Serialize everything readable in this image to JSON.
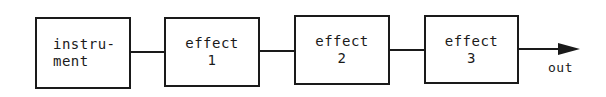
{
  "diagram": {
    "type": "signal-chain-block-diagram",
    "blocks": [
      {
        "id": "instrument",
        "lines": [
          "instru-",
          "ment"
        ]
      },
      {
        "id": "effect1",
        "lines": [
          "effect",
          "1"
        ]
      },
      {
        "id": "effect2",
        "lines": [
          "effect",
          "2"
        ]
      },
      {
        "id": "effect3",
        "lines": [
          "effect",
          "3"
        ]
      }
    ],
    "connections": [
      {
        "from": "instrument",
        "to": "effect1"
      },
      {
        "from": "effect1",
        "to": "effect2"
      },
      {
        "from": "effect2",
        "to": "effect3"
      },
      {
        "from": "effect3",
        "to": "out",
        "arrow": true
      }
    ],
    "output_label": "out",
    "colors": {
      "stroke": "#1a1a1a",
      "background": "#ffffff"
    }
  }
}
